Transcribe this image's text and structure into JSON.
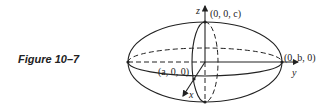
{
  "caption": "Figure 10–7",
  "diagram": {
    "type": "ellipsoid",
    "axes": {
      "x": "x",
      "y": "y",
      "z": "z"
    },
    "points": {
      "top": "(0, 0, c)",
      "right": "(0, b, 0)",
      "front": "(a, 0, 0)"
    },
    "colors": {
      "stroke": "#222222",
      "background": "#ffffff"
    }
  }
}
